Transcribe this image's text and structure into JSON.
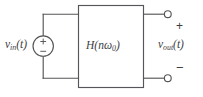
{
  "diagram": {
    "type": "circuit-block-diagram",
    "colors": {
      "background": "#ffffff",
      "line": "#56565a",
      "text": "#3d3d42"
    },
    "source": {
      "name": "independent-voltage-source",
      "label_base": "v",
      "label_sub": "in",
      "label_suffix": "(t)",
      "label_full": "v_in(t)",
      "inner_plus": "+",
      "inner_minus": "−"
    },
    "block": {
      "name": "transfer-function-block",
      "label_h": "H",
      "label_open": "(",
      "label_n": "n",
      "label_omega": "ω",
      "label_omega_sub": "0",
      "label_close": ")",
      "label_full": "H(nω0)"
    },
    "output": {
      "name": "output-port",
      "label_base": "v",
      "label_sub": "out",
      "label_suffix": "(t)",
      "label_full": "v_out(t)",
      "polarity_plus": "+",
      "polarity_minus": "−",
      "terminal_top": "open-terminal-node",
      "terminal_bottom": "open-terminal-node"
    }
  }
}
